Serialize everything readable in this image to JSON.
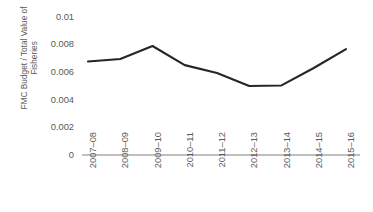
{
  "chart_data": {
    "type": "line",
    "title": "",
    "xlabel": "",
    "ylabel": "FMC Budget / Total Value of\nFisheries",
    "categories": [
      "2007–08",
      "2008–09",
      "2009–10",
      "2010–11",
      "2011–12",
      "2012–13",
      "2013–14",
      "2014–15",
      "2015–16"
    ],
    "values": [
      0.00676,
      0.00694,
      0.00788,
      0.0065,
      0.00593,
      0.00499,
      0.00503,
      0.00629,
      0.00766
    ],
    "ylim": [
      0,
      0.01
    ],
    "y_ticks": [
      0,
      0.002,
      0.004,
      0.006,
      0.008,
      0.01
    ],
    "y_tick_labels": [
      "0",
      "0.002",
      "0.004",
      "0.006",
      "0.008",
      "0.01"
    ],
    "grid": false,
    "legend": false,
    "series": [
      {
        "name": "FMC Budget / Total Value of Fisheries",
        "values": [
          0.00676,
          0.00694,
          0.00788,
          0.0065,
          0.00593,
          0.00499,
          0.00503,
          0.00629,
          0.00766
        ]
      }
    ],
    "colors": {
      "line": "#262626",
      "axis": "#808080",
      "text": "#595959",
      "background": "#ffffff"
    }
  }
}
